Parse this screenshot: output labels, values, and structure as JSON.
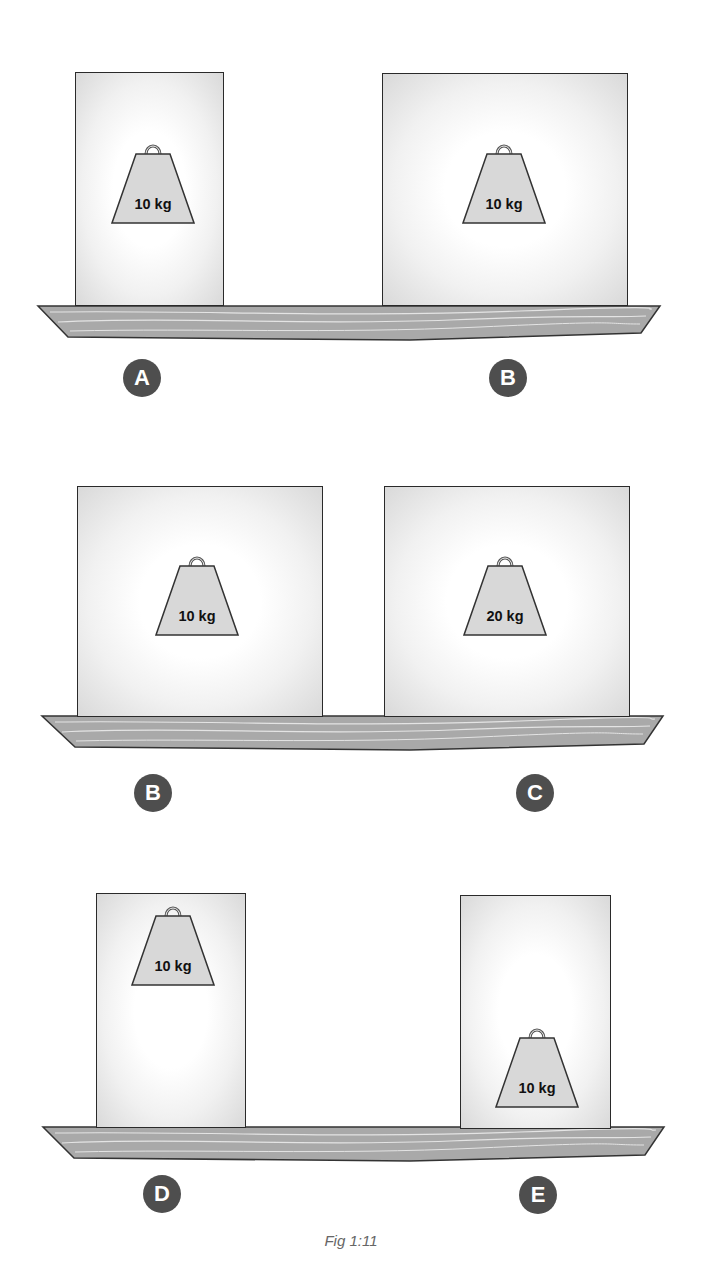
{
  "figure": {
    "caption": "Fig 1:11",
    "colors": {
      "board_fill": "#a9a9a9",
      "board_grain": "#e4e4e4",
      "outline": "#2a2a2a",
      "badge_fill": "#4e4e4e",
      "badge_text": "#ffffff",
      "weight_fill": "#d8d8d8"
    },
    "comparisons": [
      {
        "row": 1,
        "left": {
          "label": "A",
          "weight": "10 kg",
          "box_shape": "tall narrow",
          "weight_position": "center"
        },
        "right": {
          "label": "B",
          "weight": "10 kg",
          "box_shape": "wide square",
          "weight_position": "center"
        }
      },
      {
        "row": 2,
        "left": {
          "label": "B",
          "weight": "10 kg",
          "box_shape": "wide square",
          "weight_position": "center"
        },
        "right": {
          "label": "C",
          "weight": "20 kg",
          "box_shape": "wide square",
          "weight_position": "center"
        }
      },
      {
        "row": 3,
        "left": {
          "label": "D",
          "weight": "10 kg",
          "box_shape": "tall narrow",
          "weight_position": "top"
        },
        "right": {
          "label": "E",
          "weight": "10 kg",
          "box_shape": "tall narrow",
          "weight_position": "bottom"
        }
      }
    ]
  }
}
